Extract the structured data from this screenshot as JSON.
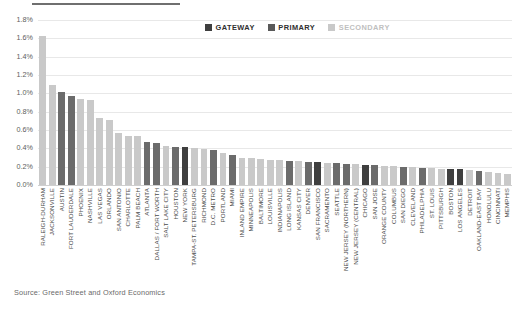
{
  "header": {
    "title_partial": "",
    "rule": "divider"
  },
  "legend": {
    "position": "top-right",
    "items": [
      {
        "label": "GATEWAY",
        "color": "#3f3f3f"
      },
      {
        "label": "PRIMARY",
        "color": "#595959"
      },
      {
        "label": "SECONDARY",
        "color": "#c9c9c9"
      }
    ]
  },
  "source": {
    "text": "Source: Green Street and Oxford Economics"
  },
  "chart_data": {
    "type": "bar",
    "title": "",
    "subtitle": "",
    "xlabel": "",
    "ylabel": "",
    "ylim": [
      0,
      1.8
    ],
    "ytick_labels": [
      "1.8%",
      "1.6%",
      "1.4%",
      "1.2%",
      "1.0%",
      "0.8%",
      "0.6%",
      "0.4%",
      "0.2%",
      "0.0%"
    ],
    "ytick_values": [
      1.8,
      1.6,
      1.4,
      1.2,
      1.0,
      0.8,
      0.6,
      0.4,
      0.2,
      0.0
    ],
    "grid": true,
    "legend_position": "top-right",
    "value_unit": "percent",
    "categories": [
      "RALEIGH-DURHAM",
      "JACKSONVILLE",
      "AUSTIN",
      "FORT LAUDERDALE",
      "PHOENIX",
      "NASHVILLE",
      "LAS VEGAS",
      "ORLANDO",
      "SAN ANTONIO",
      "CHARLOTTE",
      "PALM BEACH",
      "ATLANTA",
      "DALLAS / FORT WORTH",
      "SALT LAKE CITY",
      "HOUSTON",
      "NEW YORK",
      "TAMPA-ST. PETERSBURG",
      "RICHMOND",
      "D.C. METRO",
      "PORTLAND",
      "MIAMI",
      "INLAND EMPIRE",
      "MINNEAPOLIS",
      "BALTIMORE",
      "LOUISVILLE",
      "INDIANAPOLIS",
      "LONG ISLAND",
      "KANSAS CITY",
      "DENVER",
      "SAN FRANCISCO",
      "SACRAMENTO",
      "SEATTLE",
      "NEW JERSEY (NORTHERN)",
      "NEW JERSEY (CENTRAL)",
      "CHICAGO",
      "SAN JOSE",
      "ORANGE COUNTY",
      "COLUMBUS",
      "SAN DIEGO",
      "CLEVELAND",
      "PHILADELPHIA",
      "ST. LOUIS",
      "PITTSBURGH",
      "BOSTON",
      "LOS ANGELES",
      "DETROIT",
      "OAKLAND-EAST BAY",
      "HONOLULU",
      "CINCINNATI",
      "MEMPHIS"
    ],
    "values": [
      1.63,
      1.09,
      1.02,
      0.97,
      0.94,
      0.93,
      0.73,
      0.71,
      0.57,
      0.53,
      0.53,
      0.47,
      0.46,
      0.43,
      0.42,
      0.41,
      0.4,
      0.39,
      0.38,
      0.35,
      0.33,
      0.3,
      0.29,
      0.28,
      0.27,
      0.27,
      0.26,
      0.26,
      0.25,
      0.25,
      0.24,
      0.24,
      0.23,
      0.23,
      0.22,
      0.22,
      0.21,
      0.21,
      0.2,
      0.2,
      0.19,
      0.19,
      0.18,
      0.18,
      0.17,
      0.16,
      0.15,
      0.14,
      0.13,
      0.12
    ],
    "group": [
      "secondary",
      "secondary",
      "primary",
      "primary",
      "secondary",
      "secondary",
      "secondary",
      "secondary",
      "secondary",
      "secondary",
      "secondary",
      "primary",
      "primary",
      "secondary",
      "primary",
      "gateway",
      "secondary",
      "secondary",
      "primary",
      "secondary",
      "primary",
      "secondary",
      "secondary",
      "secondary",
      "secondary",
      "secondary",
      "primary",
      "secondary",
      "primary",
      "gateway",
      "secondary",
      "primary",
      "primary",
      "secondary",
      "gateway",
      "primary",
      "secondary",
      "secondary",
      "primary",
      "secondary",
      "primary",
      "secondary",
      "secondary",
      "gateway",
      "gateway",
      "secondary",
      "primary",
      "secondary",
      "secondary",
      "secondary"
    ],
    "colors": {
      "gateway": "#3f3f3f",
      "primary": "#6b6b6b",
      "secondary": "#c9c9c9"
    }
  }
}
